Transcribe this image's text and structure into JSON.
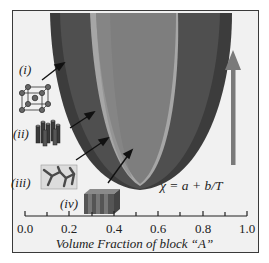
{
  "diagram": {
    "equation": "χ = a + b/T",
    "phases": [
      {
        "id": "i",
        "label": "(i)",
        "icon": "bcc-sphere-lattice-icon",
        "name": "spheres"
      },
      {
        "id": "ii",
        "label": "(ii)",
        "icon": "hexagonal-cylinders-icon",
        "name": "cylinders"
      },
      {
        "id": "iii",
        "label": "(iii)",
        "icon": "gyroid-network-icon",
        "name": "gyroid"
      },
      {
        "id": "iv",
        "label": "(iv)",
        "icon": "lamellae-icon",
        "name": "lamellae"
      }
    ],
    "arrow": {
      "direction": "up",
      "meaning": "increasing χ",
      "color": "#7a7a7a"
    },
    "colors": {
      "outer_band": "#3c3c3c",
      "cylinder_band": "#555555",
      "gyroid_band": "#a4a4a4",
      "lamellae_core": "#7d7d7d",
      "background": "#f1f1f1"
    }
  },
  "axis": {
    "xlabel": "Volume Fraction of block “A”",
    "ticks": [
      "0.0",
      "0.2",
      "0.4",
      "0.6",
      "0.8",
      "1.0"
    ],
    "range": [
      0.0,
      1.0
    ],
    "minor_ticks_every": 0.1
  }
}
